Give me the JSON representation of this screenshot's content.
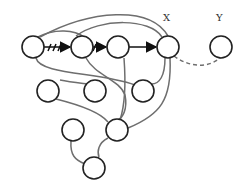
{
  "diagram": {
    "labels": {
      "x": "X",
      "y": "Y"
    },
    "nodes": [
      {
        "id": "A",
        "cx": 33,
        "cy": 47
      },
      {
        "id": "B",
        "cx": 82,
        "cy": 47
      },
      {
        "id": "C",
        "cx": 118,
        "cy": 47
      },
      {
        "id": "X",
        "cx": 168,
        "cy": 47
      },
      {
        "id": "Y",
        "cx": 221,
        "cy": 47
      },
      {
        "id": "D",
        "cx": 48,
        "cy": 91
      },
      {
        "id": "E",
        "cx": 95,
        "cy": 91
      },
      {
        "id": "F",
        "cx": 143,
        "cy": 91
      },
      {
        "id": "G",
        "cx": 73,
        "cy": 130
      },
      {
        "id": "H",
        "cx": 117,
        "cy": 130
      },
      {
        "id": "I",
        "cx": 94,
        "cy": 168
      }
    ],
    "edge_color": "#6e6e6e",
    "node_stroke": "#222222"
  }
}
